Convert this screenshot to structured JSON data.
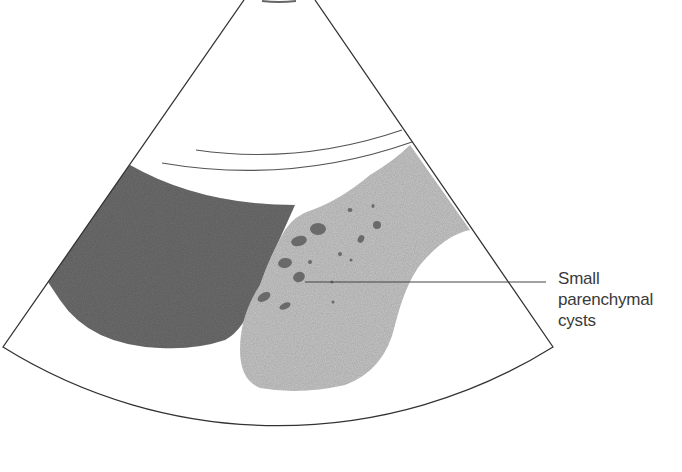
{
  "figure": {
    "type": "ultrasound schematic",
    "colors": {
      "background": "#ffffff",
      "outline": "#333333",
      "dark_region": "#6e6e6e",
      "light_region": "#c8c8c8",
      "cysts": "#6a6a6a"
    }
  },
  "annotations": [
    {
      "id": "cysts-label",
      "lines": [
        "Small",
        "parenchymal",
        "cysts"
      ],
      "points_to": "small dark oval cysts within light gray parenchyma"
    }
  ]
}
